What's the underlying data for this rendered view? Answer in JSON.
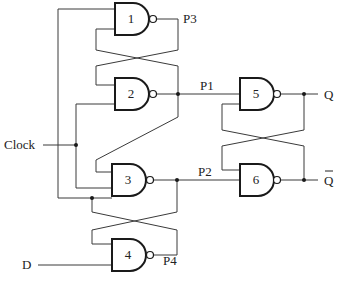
{
  "diagram": {
    "type": "logic-circuit",
    "gates": [
      {
        "id": "1",
        "label": "1",
        "type": "NAND",
        "inputs": 2
      },
      {
        "id": "2",
        "label": "2",
        "type": "NAND",
        "inputs": 2
      },
      {
        "id": "3",
        "label": "3",
        "type": "NAND",
        "inputs": 3
      },
      {
        "id": "4",
        "label": "4",
        "type": "NAND",
        "inputs": 2
      },
      {
        "id": "5",
        "label": "5",
        "type": "NAND",
        "inputs": 2
      },
      {
        "id": "6",
        "label": "6",
        "type": "NAND",
        "inputs": 2
      }
    ],
    "inputs": {
      "clock": "Clock",
      "d": "D"
    },
    "nodes": {
      "p1": "P1",
      "p2": "P2",
      "p3": "P3",
      "p4": "P4"
    },
    "outputs": {
      "q": "Q",
      "q_bar": "Q"
    },
    "colors": {
      "line": "#3a3a3a",
      "gate_outline": "#1a1a1a",
      "background": "#ffffff"
    }
  }
}
